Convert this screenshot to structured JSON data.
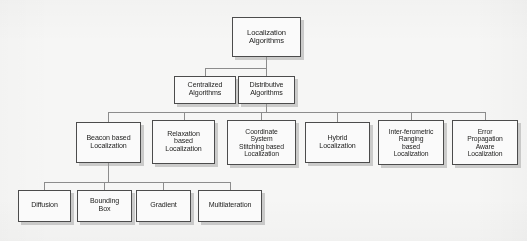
{
  "diagram": {
    "type": "tree-hierarchy",
    "colors": {
      "box_border": "#4a4a4a",
      "box_fill": "#ffffff",
      "shadow": "#969696",
      "connector": "#8d8d8d",
      "background": "#fbfbfa",
      "text": "#20201f"
    },
    "levels": [
      {
        "level": 1,
        "nodes": [
          {
            "id": "root",
            "label": "Localization\nAlgorithms"
          }
        ]
      },
      {
        "level": 2,
        "nodes": [
          {
            "id": "centralized",
            "label": "Centralized\nAlgorithms"
          },
          {
            "id": "distributive",
            "label": "Distributive\nAlgorithms"
          }
        ]
      },
      {
        "level": 3,
        "nodes": [
          {
            "id": "beacon",
            "label": "Beacon based\nLocalization"
          },
          {
            "id": "relaxation",
            "label": "Relaxation\nbased\nLocalization"
          },
          {
            "id": "coordinate",
            "label": "Coordinate\nSystem\nStitching based\nLocalization"
          },
          {
            "id": "hybrid",
            "label": "Hybrid\nLocalization"
          },
          {
            "id": "interferometric",
            "label": "Inter-ferometric\nRanging\nbased\nLocalization"
          },
          {
            "id": "error",
            "label": "Error\nPropagation\nAware\nLocalization"
          }
        ]
      },
      {
        "level": 4,
        "nodes": [
          {
            "id": "diffusion",
            "label": "Diffusion"
          },
          {
            "id": "bounding",
            "label": "Bounding\nBox"
          },
          {
            "id": "gradient",
            "label": "Gradient"
          },
          {
            "id": "multilateration",
            "label": "Multilateration"
          }
        ]
      }
    ],
    "edges": [
      {
        "from": "root",
        "to": "centralized"
      },
      {
        "from": "root",
        "to": "distributive"
      },
      {
        "from": "distributive",
        "to": "beacon"
      },
      {
        "from": "distributive",
        "to": "relaxation"
      },
      {
        "from": "distributive",
        "to": "coordinate"
      },
      {
        "from": "distributive",
        "to": "hybrid"
      },
      {
        "from": "distributive",
        "to": "interferometric"
      },
      {
        "from": "distributive",
        "to": "error"
      },
      {
        "from": "beacon",
        "to": "diffusion"
      },
      {
        "from": "beacon",
        "to": "bounding"
      },
      {
        "from": "beacon",
        "to": "gradient"
      },
      {
        "from": "beacon",
        "to": "multilateration"
      }
    ]
  }
}
